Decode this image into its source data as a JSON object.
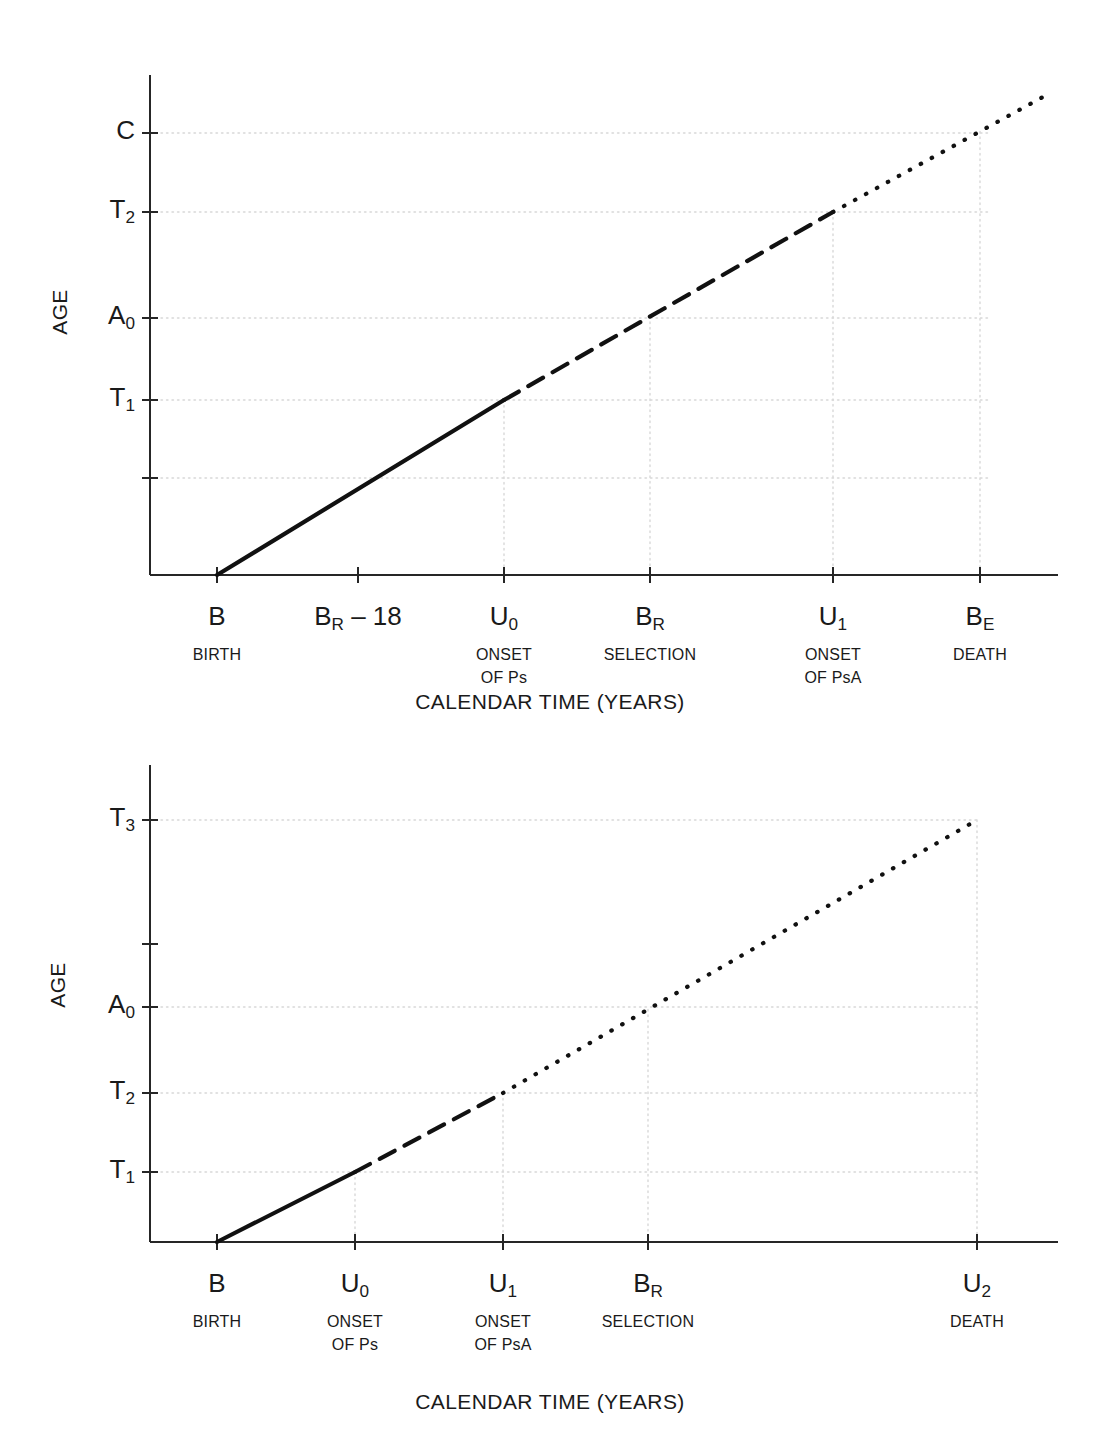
{
  "figure": {
    "panels": [
      {
        "id": "top",
        "y_axis_title": "AGE",
        "x_axis_title": "CALENDAR TIME (YEARS)",
        "y_ticks": [
          {
            "label": "C",
            "sub": "",
            "value_px": 133,
            "gridline": true
          },
          {
            "label": "T",
            "sub": "2",
            "value_px": 212,
            "gridline": true
          },
          {
            "label": "A",
            "sub": "0",
            "value_px": 318,
            "gridline": true
          },
          {
            "label": "T",
            "sub": "1",
            "value_px": 400,
            "gridline": true
          },
          {
            "label": "",
            "sub": "",
            "value_px": 478,
            "gridline": true
          }
        ],
        "x_ticks": [
          {
            "label": "B",
            "sub": "",
            "suffix": "",
            "desc": [
              "BIRTH"
            ],
            "value_px": 217,
            "gridline": false
          },
          {
            "label": "B",
            "sub": "R",
            "suffix": " – 18",
            "desc": [],
            "value_px": 358,
            "gridline": false
          },
          {
            "label": "U",
            "sub": "0",
            "suffix": "",
            "desc": [
              "ONSET",
              "OF Ps"
            ],
            "value_px": 504,
            "gridline": true
          },
          {
            "label": "B",
            "sub": "R",
            "suffix": "",
            "desc": [
              "SELECTION"
            ],
            "value_px": 650,
            "gridline": true
          },
          {
            "label": "U",
            "sub": "1",
            "suffix": "",
            "desc": [
              "ONSET",
              "OF PsA"
            ],
            "value_px": 833,
            "gridline": true
          },
          {
            "label": "B",
            "sub": "E",
            "suffix": "",
            "desc": [
              "DEATH"
            ],
            "value_px": 980,
            "gridline": true
          }
        ],
        "segments": [
          {
            "style": "solid",
            "from_x": 217,
            "from_y": 575,
            "to_x": 504,
            "to_y": 400
          },
          {
            "style": "dashed",
            "from_x": 504,
            "from_y": 400,
            "to_x": 833,
            "to_y": 212
          },
          {
            "style": "dotted",
            "from_x": 833,
            "from_y": 212,
            "to_x": 1052,
            "to_y": 92
          }
        ]
      },
      {
        "id": "bottom",
        "y_axis_title": "AGE",
        "x_axis_title": "CALENDAR TIME (YEARS)",
        "y_ticks": [
          {
            "label": "T",
            "sub": "3",
            "value_px": 820,
            "gridline": true
          },
          {
            "label": "",
            "sub": "",
            "value_px": 944,
            "gridline": false
          },
          {
            "label": "A",
            "sub": "0",
            "value_px": 1007,
            "gridline": true
          },
          {
            "label": "T",
            "sub": "2",
            "value_px": 1093,
            "gridline": true
          },
          {
            "label": "T",
            "sub": "1",
            "value_px": 1172,
            "gridline": true
          }
        ],
        "x_ticks": [
          {
            "label": "B",
            "sub": "",
            "suffix": "",
            "desc": [
              "BIRTH"
            ],
            "value_px": 217,
            "gridline": false
          },
          {
            "label": "U",
            "sub": "0",
            "suffix": "",
            "desc": [
              "ONSET",
              "OF Ps"
            ],
            "value_px": 355,
            "gridline": true
          },
          {
            "label": "U",
            "sub": "1",
            "suffix": "",
            "desc": [
              "ONSET",
              "OF PsA"
            ],
            "value_px": 503,
            "gridline": true
          },
          {
            "label": "B",
            "sub": "R",
            "suffix": "",
            "desc": [
              "SELECTION"
            ],
            "value_px": 648,
            "gridline": true
          },
          {
            "label": "U",
            "sub": "2",
            "suffix": "",
            "desc": [
              "DEATH"
            ],
            "value_px": 977,
            "gridline": true
          }
        ],
        "segments": [
          {
            "style": "solid",
            "from_x": 217,
            "from_y": 1242,
            "to_x": 355,
            "to_y": 1172
          },
          {
            "style": "dashed",
            "from_x": 355,
            "from_y": 1172,
            "to_x": 503,
            "to_y": 1093
          },
          {
            "style": "dotted",
            "from_x": 503,
            "from_y": 1093,
            "to_x": 977,
            "to_y": 820
          }
        ]
      }
    ]
  },
  "chart_data": {
    "type": "line",
    "title": "",
    "charts": [
      {
        "name": "top-panel",
        "xlabel": "CALENDAR TIME (YEARS)",
        "ylabel": "AGE",
        "grid": true,
        "legend": "none",
        "x_tick_labels": [
          "B",
          "B_R – 18",
          "U_0",
          "B_R",
          "U_1",
          "B_E"
        ],
        "x_tick_descriptions": [
          "BIRTH",
          "",
          "ONSET OF Ps",
          "SELECTION",
          "ONSET OF PsA",
          "DEATH"
        ],
        "y_tick_labels": [
          "",
          "T_1",
          "A_0",
          "T_2",
          "C"
        ],
        "series": [
          {
            "name": "age-trajectory",
            "points": [
              {
                "x": "B",
                "y": 0,
                "style": "solid"
              },
              {
                "x": "U_0",
                "y": "T_1",
                "style": "solid"
              },
              {
                "x": "U_1",
                "y": "T_2",
                "style": "dashed"
              },
              {
                "x": "beyond B_E",
                "y": "above C",
                "style": "dotted"
              }
            ]
          }
        ],
        "annotations": [
          "Solid line from B (birth) to U_0 (onset of Ps), reaching age T_1",
          "Dashed line from U_0 to U_1 (onset of PsA), reaching age T_2",
          "Dotted line from U_1 continuing past B_E (death), exceeding age C"
        ]
      },
      {
        "name": "bottom-panel",
        "xlabel": "CALENDAR TIME (YEARS)",
        "ylabel": "AGE",
        "grid": true,
        "legend": "none",
        "x_tick_labels": [
          "B",
          "U_0",
          "U_1",
          "B_R",
          "U_2"
        ],
        "x_tick_descriptions": [
          "BIRTH",
          "ONSET OF Ps",
          "ONSET OF PsA",
          "SELECTION",
          "DEATH"
        ],
        "y_tick_labels": [
          "T_1",
          "T_2",
          "A_0",
          "",
          "T_3"
        ],
        "series": [
          {
            "name": "age-trajectory",
            "points": [
              {
                "x": "B",
                "y": 0,
                "style": "solid"
              },
              {
                "x": "U_0",
                "y": "T_1",
                "style": "solid"
              },
              {
                "x": "U_1",
                "y": "T_2",
                "style": "dashed"
              },
              {
                "x": "U_2",
                "y": "T_3",
                "style": "dotted"
              }
            ]
          }
        ],
        "annotations": [
          "Solid line from B (birth) to U_0 (onset of Ps), reaching age T_1",
          "Dashed line from U_0 to U_1 (onset of PsA), reaching age T_2",
          "Dotted line from U_1 to U_2 (death), reaching age T_3"
        ]
      }
    ]
  },
  "style": {
    "axis_color": "#262626",
    "grid_color": "#d8d8d8",
    "line_color": "#111111",
    "background": "#ffffff"
  }
}
